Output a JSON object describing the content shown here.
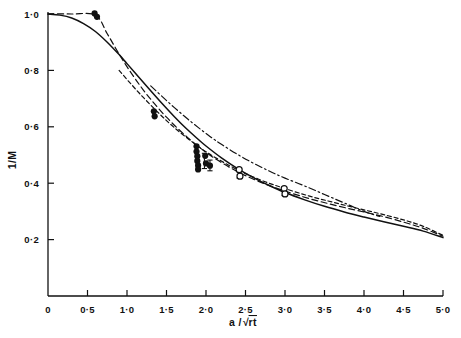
{
  "chart_data": {
    "type": "line",
    "title": "",
    "xlabel": "a/√rt",
    "ylabel": "1/M",
    "xlim": [
      0,
      5.0
    ],
    "ylim": [
      0,
      1.05
    ],
    "grid": false,
    "legend_position": "none",
    "xticks": [
      0,
      0.5,
      1.0,
      1.5,
      2.0,
      2.5,
      3.0,
      3.5,
      4.0,
      4.5,
      5.0
    ],
    "xtick_labels": [
      "0",
      "0·5",
      "1·0",
      "1·5",
      "2·0",
      "2·5",
      "3·0",
      "3·5",
      "4·0",
      "4·5",
      "5·0"
    ],
    "yticks": [
      0.2,
      0.4,
      0.6,
      0.8,
      1.0
    ],
    "ytick_labels": [
      "0·2",
      "0·4",
      "0·6",
      "0·8",
      "1·0"
    ],
    "series": [
      {
        "name": "theoretical-curve",
        "style": "solid",
        "points": [
          [
            0.0,
            1.0
          ],
          [
            0.15,
            0.996
          ],
          [
            0.3,
            0.986
          ],
          [
            0.45,
            0.966
          ],
          [
            0.6,
            0.938
          ],
          [
            0.75,
            0.9
          ],
          [
            0.9,
            0.856
          ],
          [
            1.0,
            0.824
          ],
          [
            1.15,
            0.776
          ],
          [
            1.3,
            0.728
          ],
          [
            1.45,
            0.681
          ],
          [
            1.6,
            0.636
          ],
          [
            1.75,
            0.594
          ],
          [
            1.9,
            0.556
          ],
          [
            2.0,
            0.532
          ],
          [
            2.2,
            0.489
          ],
          [
            2.4,
            0.452
          ],
          [
            2.6,
            0.42
          ],
          [
            2.8,
            0.392
          ],
          [
            3.0,
            0.367
          ],
          [
            3.25,
            0.341
          ],
          [
            3.5,
            0.318
          ],
          [
            3.75,
            0.298
          ],
          [
            4.0,
            0.28
          ],
          [
            4.25,
            0.263
          ],
          [
            4.5,
            0.247
          ],
          [
            4.75,
            0.23
          ],
          [
            5.0,
            0.207
          ]
        ]
      },
      {
        "name": "experimental-curve-upper",
        "style": "dash-dot",
        "points": [
          [
            1.3,
            0.745
          ],
          [
            1.45,
            0.706
          ],
          [
            1.6,
            0.668
          ],
          [
            1.75,
            0.632
          ],
          [
            1.9,
            0.598
          ],
          [
            2.05,
            0.566
          ],
          [
            2.2,
            0.537
          ],
          [
            2.4,
            0.502
          ],
          [
            2.6,
            0.471
          ],
          [
            2.8,
            0.443
          ],
          [
            3.0,
            0.418
          ],
          [
            3.25,
            0.39
          ],
          [
            3.5,
            0.36
          ],
          [
            3.75,
            0.33
          ],
          [
            4.0,
            0.3
          ],
          [
            4.2,
            0.282
          ]
        ]
      },
      {
        "name": "experimental-curve-middle",
        "style": "dashed",
        "points": [
          [
            0.0,
            1.0
          ],
          [
            0.3,
            1.0
          ],
          [
            0.6,
            0.996
          ],
          [
            0.75,
            0.93
          ],
          [
            0.9,
            0.858
          ],
          [
            1.05,
            0.792
          ],
          [
            1.2,
            0.733
          ],
          [
            1.35,
            0.681
          ],
          [
            1.5,
            0.634
          ],
          [
            1.65,
            0.592
          ],
          [
            1.8,
            0.554
          ],
          [
            1.95,
            0.52
          ],
          [
            2.1,
            0.49
          ],
          [
            2.3,
            0.456
          ],
          [
            2.5,
            0.427
          ],
          [
            2.75,
            0.397
          ],
          [
            3.0,
            0.372
          ],
          [
            3.3,
            0.346
          ],
          [
            3.6,
            0.324
          ],
          [
            3.9,
            0.304
          ],
          [
            4.2,
            0.285
          ],
          [
            4.5,
            0.262
          ],
          [
            4.75,
            0.24
          ],
          [
            5.0,
            0.212
          ]
        ]
      },
      {
        "name": "experimental-curve-lower",
        "style": "dashed-fine",
        "points": [
          [
            0.9,
            0.8
          ],
          [
            1.05,
            0.752
          ],
          [
            1.2,
            0.706
          ],
          [
            1.35,
            0.663
          ],
          [
            1.5,
            0.622
          ],
          [
            1.65,
            0.585
          ],
          [
            1.8,
            0.552
          ],
          [
            1.95,
            0.521
          ],
          [
            2.1,
            0.494
          ],
          [
            2.3,
            0.462
          ],
          [
            2.5,
            0.434
          ],
          [
            2.75,
            0.405
          ],
          [
            3.0,
            0.381
          ],
          [
            3.3,
            0.355
          ],
          [
            3.6,
            0.333
          ],
          [
            3.9,
            0.312
          ],
          [
            4.2,
            0.292
          ],
          [
            4.5,
            0.27
          ],
          [
            4.75,
            0.247
          ],
          [
            5.0,
            0.215
          ]
        ]
      }
    ],
    "filled_markers": [
      {
        "x": 0.59,
        "y": 1.002
      },
      {
        "x": 0.62,
        "y": 0.99
      },
      {
        "x": 1.34,
        "y": 0.655
      },
      {
        "x": 1.35,
        "y": 0.637
      },
      {
        "x": 1.88,
        "y": 0.531
      },
      {
        "x": 1.88,
        "y": 0.512
      },
      {
        "x": 1.89,
        "y": 0.496
      },
      {
        "x": 1.89,
        "y": 0.479
      },
      {
        "x": 1.9,
        "y": 0.463
      },
      {
        "x": 1.9,
        "y": 0.449
      },
      {
        "x": 1.99,
        "y": 0.497
      },
      {
        "x": 2.0,
        "y": 0.47
      },
      {
        "x": 2.05,
        "y": 0.462
      }
    ],
    "open_markers": [
      {
        "x": 2.42,
        "y": 0.448
      },
      {
        "x": 2.43,
        "y": 0.425
      },
      {
        "x": 2.99,
        "y": 0.381
      },
      {
        "x": 3.0,
        "y": 0.362
      }
    ],
    "error_bars": [
      {
        "x": 1.98,
        "y_low": 0.452,
        "y_high": 0.506
      },
      {
        "x": 2.05,
        "y_low": 0.444,
        "y_high": 0.482
      },
      {
        "x": 2.42,
        "y_low": 0.418,
        "y_high": 0.455
      },
      {
        "x": 2.99,
        "y_low": 0.356,
        "y_high": 0.388
      }
    ],
    "colors": {
      "line": "#111111",
      "marker_fill": "#111111",
      "background": "#ffffff"
    }
  }
}
